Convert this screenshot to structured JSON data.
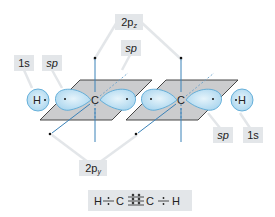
{
  "diagram": {
    "labels": {
      "top_2p": {
        "main": "2p",
        "sub": "z"
      },
      "top_sp": "sp",
      "left_1s": "1s",
      "left_sp": "sp",
      "right_sp": "sp",
      "right_1s": "1s",
      "bottom_2p": {
        "main": "2p",
        "sub": "y"
      }
    },
    "atoms": {
      "left_h": "H",
      "left_c": "C",
      "right_c": "C",
      "right_h": "H"
    },
    "formula": {
      "text": "H ⁘ C ⠿ C ⁘ H",
      "parts": [
        "H",
        "C",
        "C",
        "H"
      ]
    },
    "colors": {
      "orbital_fill": "#bfe0f3",
      "orbital_stroke": "#5aa9d6",
      "plane_fill": "#c8c9cb",
      "plane_stroke": "#333333",
      "axis_line": "#3b82b8",
      "label_bg": "#e3e6e9",
      "leader_line": "#e5e7e9"
    }
  }
}
